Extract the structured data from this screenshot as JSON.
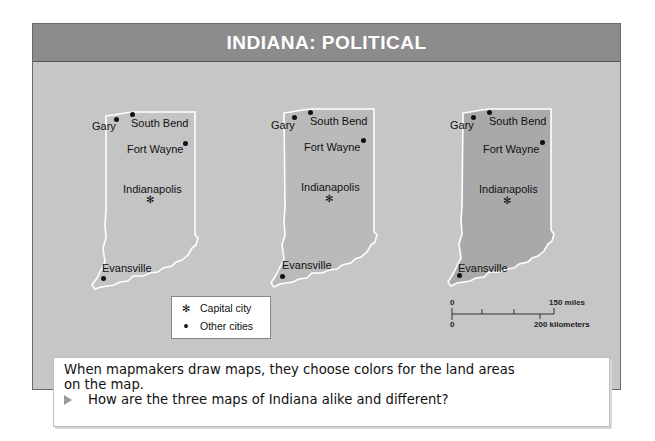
{
  "title": "INDIANA: POLITICAL",
  "maps": [
    {
      "fill": "#c4c4c4",
      "offset_x": 0
    },
    {
      "fill": "#bababa",
      "offset_x": 186
    },
    {
      "fill": "#a9a9a9",
      "offset_x": 373
    }
  ],
  "cities": {
    "gary": "Gary",
    "south_bend": "South Bend",
    "fort_wayne": "Fort Wayne",
    "indianapolis": "Indianapolis",
    "evansville": "Evansville"
  },
  "legend": {
    "capital_label": "Capital city",
    "other_label": "Other cities",
    "capital_symbol": "✻",
    "other_symbol": "•"
  },
  "scale": {
    "top_zero": "0",
    "miles": "150 miles",
    "bottom_zero": "0",
    "kilometers": "200 kilometers"
  },
  "caption": {
    "line1": "When mapmakers draw maps, they choose colors for the land areas",
    "line2": "on the map.",
    "question": "How are the three maps of Indiana alike and different?"
  }
}
